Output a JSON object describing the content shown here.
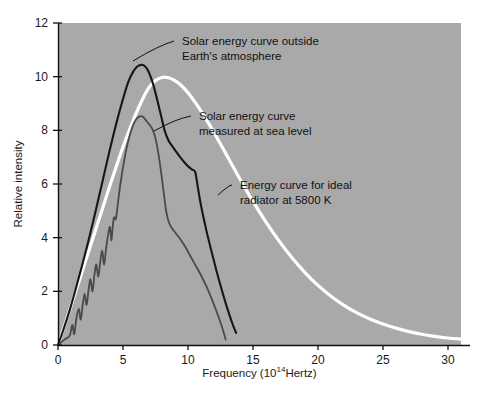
{
  "chart_data": {
    "type": "line",
    "title": "",
    "xlabel": "Frequency (10^14 Hertz)",
    "xlabel_base": "Frequency (10",
    "xlabel_exp": "14",
    "xlabel_tail": " Hertz)",
    "ylabel": "Relative intensity",
    "xlim": [
      0,
      31
    ],
    "ylim": [
      0,
      12
    ],
    "xticks": [
      0,
      5,
      10,
      15,
      20,
      25,
      30
    ],
    "xtick_labels": [
      "0",
      "5",
      "10",
      "15",
      "20",
      "25",
      "30"
    ],
    "yticks": [
      0,
      2,
      4,
      6,
      8,
      10,
      12
    ],
    "ytick_labels": [
      "0",
      "2",
      "4",
      "6",
      "8",
      "10",
      "12"
    ],
    "grid": false,
    "legend_position": "inline-annotations",
    "plot_background": "#a9a9a9",
    "series": [
      {
        "name": "Energy curve for ideal radiator at 5800 K",
        "color": "#ffffff",
        "linewidth": 3.2,
        "x": [
          0,
          0.5,
          1,
          1.5,
          2,
          2.5,
          3,
          3.5,
          4,
          4.5,
          5,
          5.5,
          6,
          6.5,
          7,
          7.5,
          8,
          8.5,
          9,
          9.5,
          10,
          10.5,
          11,
          11.5,
          12,
          13,
          14,
          15,
          16,
          17,
          18,
          19,
          20,
          21,
          22,
          23,
          24,
          25,
          26,
          27,
          28,
          29,
          30,
          31
        ],
        "y": [
          0,
          0.72,
          1.45,
          2.2,
          2.95,
          3.7,
          4.45,
          5.2,
          5.95,
          6.68,
          7.38,
          8.02,
          8.62,
          9.16,
          9.6,
          9.86,
          9.97,
          9.96,
          9.85,
          9.66,
          9.4,
          9.08,
          8.72,
          8.33,
          7.92,
          7.05,
          6.18,
          5.35,
          4.58,
          3.88,
          3.25,
          2.7,
          2.22,
          1.82,
          1.48,
          1.2,
          0.97,
          0.78,
          0.63,
          0.5,
          0.4,
          0.32,
          0.26,
          0.22
        ]
      },
      {
        "name": "Solar energy curve outside Earth's atmosphere",
        "color": "#161616",
        "linewidth": 2.1,
        "x": [
          0,
          0.4,
          0.9,
          1.4,
          1.9,
          2.4,
          2.9,
          3.4,
          3.9,
          4.4,
          4.9,
          5.4,
          5.8,
          6.1,
          6.4,
          6.6,
          6.8,
          7.0,
          7.3,
          7.6,
          7.9,
          8.2,
          8.5,
          8.8,
          9.1,
          9.4,
          9.7,
          10.0,
          10.3,
          10.55,
          10.75,
          11.0,
          11.4,
          11.8,
          12.2,
          12.6,
          13.0,
          13.4,
          13.7
        ],
        "y": [
          0,
          0.55,
          1.3,
          2.15,
          3.05,
          4.0,
          5.0,
          6.05,
          7.1,
          8.1,
          9.0,
          9.8,
          10.2,
          10.38,
          10.44,
          10.42,
          10.33,
          10.15,
          9.75,
          9.2,
          8.6,
          8.0,
          7.62,
          7.4,
          7.2,
          7.0,
          6.82,
          6.66,
          6.54,
          6.45,
          5.9,
          5.2,
          4.3,
          3.5,
          2.75,
          2.05,
          1.4,
          0.82,
          0.45
        ]
      },
      {
        "name": "Solar energy curve measured at sea level",
        "color": "#4a4a4a",
        "linewidth": 1.8,
        "x": [
          0,
          0.5,
          0.9,
          1.1,
          1.25,
          1.4,
          1.6,
          1.75,
          1.9,
          2.05,
          2.2,
          2.35,
          2.5,
          2.65,
          2.8,
          2.95,
          3.1,
          3.25,
          3.4,
          3.55,
          3.7,
          3.85,
          4.0,
          4.1,
          4.2,
          4.3,
          4.45,
          4.6,
          4.8,
          5.1,
          5.4,
          5.7,
          6.0,
          6.3,
          6.55,
          6.8,
          7.05,
          7.3,
          7.5,
          7.7,
          7.9,
          8.1,
          8.3,
          8.45,
          8.55,
          8.7,
          9.0,
          9.4,
          9.8,
          10.2,
          10.6,
          11.0,
          11.4,
          11.8,
          12.2,
          12.6,
          12.9
        ],
        "y": [
          0,
          0.2,
          0.35,
          0.75,
          0.4,
          0.95,
          1.35,
          0.95,
          1.5,
          1.9,
          1.5,
          2.05,
          2.45,
          2.0,
          2.6,
          3.0,
          2.55,
          3.1,
          3.5,
          3.0,
          3.6,
          4.1,
          4.4,
          3.9,
          4.35,
          4.75,
          4.7,
          5.25,
          6.0,
          6.9,
          7.6,
          8.1,
          8.4,
          8.52,
          8.5,
          8.35,
          8.2,
          8.0,
          7.7,
          7.2,
          6.55,
          5.8,
          5.05,
          4.7,
          4.55,
          4.4,
          4.2,
          3.95,
          3.65,
          3.3,
          2.95,
          2.6,
          2.2,
          1.75,
          1.25,
          0.7,
          0.2
        ]
      }
    ],
    "annotations": [
      {
        "id": "annot-outside-atmosphere",
        "line1": "Solar energy curve outside",
        "line2": "Earth's atmosphere",
        "text_x": 182,
        "text_y": 45,
        "target_x": 133,
        "target_y": 61
      },
      {
        "id": "annot-sea-level",
        "line1": "Solar energy curve",
        "line2": "measured at sea level",
        "text_x": 199,
        "text_y": 120,
        "target_x": 154,
        "target_y": 131
      },
      {
        "id": "annot-ideal-radiator",
        "line1": "Energy curve for ideal",
        "line2": "radiator at 5800 K",
        "text_x": 240,
        "text_y": 189,
        "target_x": 218,
        "target_y": 195
      }
    ]
  }
}
